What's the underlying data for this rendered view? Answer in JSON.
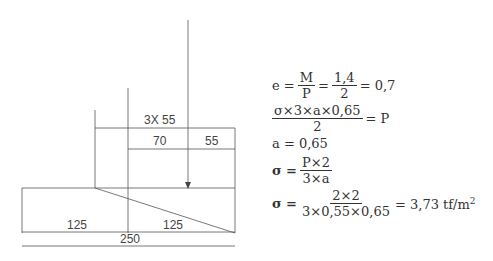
{
  "diagram": {
    "labels": {
      "total_width_top": "3X 55",
      "dim_70": "70",
      "dim_55": "55",
      "dim_left_125": "125",
      "dim_right_125": "125",
      "total_250": "250"
    }
  },
  "equations": {
    "eq1": {
      "lhs": "e =",
      "frac1_num": "M",
      "frac1_den": "P",
      "mid": "=",
      "frac2_num": "1,4",
      "frac2_den": "2",
      "rhs": "= 0,7"
    },
    "eq2": {
      "frac_num": "σ×3×a×0,65",
      "frac_den": "2",
      "rhs": "= P"
    },
    "eq3": {
      "text": "a = 0,65"
    },
    "eq4": {
      "lhs": "σ =",
      "frac_num": "P×2",
      "frac_den": "3×a"
    },
    "eq5": {
      "lhs": "σ =",
      "frac_num": "2×2",
      "frac_den": "3×0,55×0,65",
      "rhs": "= 3,73 tf/m",
      "sup": "2"
    }
  }
}
